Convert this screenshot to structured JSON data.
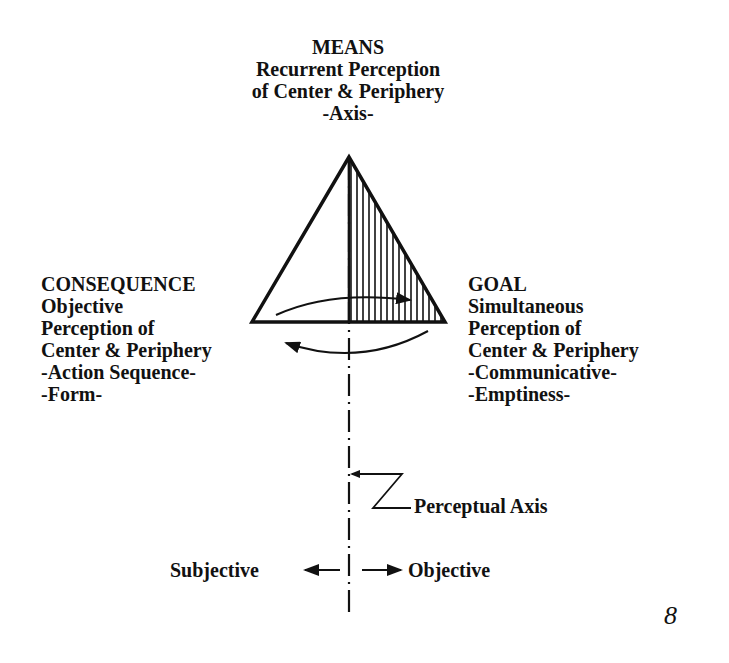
{
  "diagram": {
    "means": {
      "title": "MEANS",
      "lines": [
        "Recurrent Perception",
        "of Center & Periphery",
        "-Axis-"
      ]
    },
    "consequence": {
      "title": "CONSEQUENCE",
      "lines": [
        "Objective",
        "Perception of",
        "Center & Periphery",
        "-Action Sequence-",
        "-Form-"
      ]
    },
    "goal": {
      "title": "GOAL",
      "lines": [
        "Simultaneous",
        "Perception of",
        "Center & Periphery",
        "-Communicative-",
        "-Emptiness-"
      ]
    },
    "perceptual_axis_label": "Perceptual Axis",
    "subjective_label": "Subjective",
    "objective_label": "Objective",
    "page_number": "8",
    "colors": {
      "ink": "#111111",
      "background": "#ffffff"
    }
  }
}
